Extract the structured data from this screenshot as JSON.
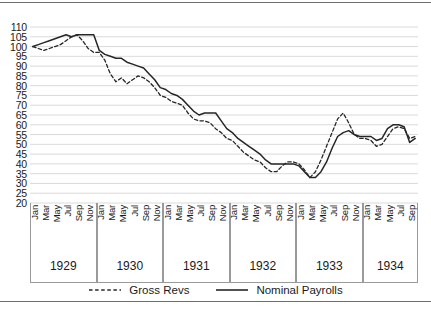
{
  "chart_data": {
    "type": "line",
    "title": "",
    "xlabel": "",
    "ylabel": "",
    "ylim": [
      20,
      110
    ],
    "ytick_step": 5,
    "grid": true,
    "legend_position": "bottom-center",
    "yticks": [
      110,
      105,
      100,
      95,
      90,
      85,
      80,
      75,
      70,
      65,
      60,
      55,
      50,
      45,
      40,
      35,
      30,
      25,
      20
    ],
    "years": [
      {
        "label": "1929",
        "months": [
          "Jan",
          "Mar",
          "May",
          "Jul",
          "Sep",
          "Nov"
        ],
        "n_points": 12
      },
      {
        "label": "1930",
        "months": [
          "Jan",
          "Mar",
          "May",
          "Jul",
          "Sep",
          "Nov"
        ],
        "n_points": 12
      },
      {
        "label": "1931",
        "months": [
          "Jan",
          "Mar",
          "May",
          "Jul",
          "Sep",
          "Nov"
        ],
        "n_points": 12
      },
      {
        "label": "1932",
        "months": [
          "Jan",
          "Mar",
          "May",
          "Jul",
          "Sep",
          "Nov"
        ],
        "n_points": 12
      },
      {
        "label": "1933",
        "months": [
          "Jan",
          "Mar",
          "May",
          "Jul",
          "Sep",
          "Nov"
        ],
        "n_points": 12
      },
      {
        "label": "1934",
        "months": [
          "Jan",
          "Mar",
          "May",
          "Jul",
          "Sep"
        ],
        "n_points": 10
      }
    ],
    "x": [
      "1929-01",
      "1929-02",
      "1929-03",
      "1929-04",
      "1929-05",
      "1929-06",
      "1929-07",
      "1929-08",
      "1929-09",
      "1929-10",
      "1929-11",
      "1929-12",
      "1930-01",
      "1930-02",
      "1930-03",
      "1930-04",
      "1930-05",
      "1930-06",
      "1930-07",
      "1930-08",
      "1930-09",
      "1930-10",
      "1930-11",
      "1930-12",
      "1931-01",
      "1931-02",
      "1931-03",
      "1931-04",
      "1931-05",
      "1931-06",
      "1931-07",
      "1931-08",
      "1931-09",
      "1931-10",
      "1931-11",
      "1931-12",
      "1932-01",
      "1932-02",
      "1932-03",
      "1932-04",
      "1932-05",
      "1932-06",
      "1932-07",
      "1932-08",
      "1932-09",
      "1932-10",
      "1932-11",
      "1932-12",
      "1933-01",
      "1933-02",
      "1933-03",
      "1933-04",
      "1933-05",
      "1933-06",
      "1933-07",
      "1933-08",
      "1933-09",
      "1933-10",
      "1933-11",
      "1933-12",
      "1934-01",
      "1934-02",
      "1934-03",
      "1934-04",
      "1934-05",
      "1934-06",
      "1934-07",
      "1934-08",
      "1934-09",
      "1934-10"
    ],
    "series": [
      {
        "name": "Gross Revs",
        "style": "dashed",
        "color": "#262626",
        "values": [
          100,
          99,
          98,
          99,
          100,
          101,
          103,
          105,
          106,
          103,
          99,
          97,
          97,
          93,
          86,
          82,
          84,
          81,
          83,
          85,
          84,
          82,
          79,
          75,
          74,
          72,
          71,
          70,
          66,
          63,
          62,
          62,
          61,
          58,
          56,
          53,
          52,
          49,
          46,
          44,
          42,
          41,
          38,
          36,
          36,
          39,
          41,
          41,
          40,
          37,
          33,
          36,
          42,
          49,
          56,
          63,
          66,
          61,
          55,
          53,
          53,
          52,
          49,
          50,
          54,
          58,
          59,
          58,
          53,
          54
        ]
      },
      {
        "name": "Nominal Payrolls",
        "style": "solid",
        "color": "#262626",
        "values": [
          100,
          101,
          102,
          103,
          104,
          105,
          106,
          105,
          106,
          106,
          106,
          106,
          98,
          96,
          95,
          94,
          94,
          92,
          91,
          90,
          89,
          86,
          83,
          79,
          78,
          76,
          75,
          73,
          70,
          67,
          65,
          66,
          66,
          66,
          62,
          58,
          56,
          53,
          51,
          49,
          47,
          45,
          42,
          40,
          40,
          40,
          40,
          40,
          39,
          36,
          33,
          33,
          36,
          41,
          48,
          54,
          56,
          57,
          55,
          54,
          54,
          54,
          52,
          53,
          58,
          60,
          60,
          59,
          51,
          53
        ]
      }
    ]
  },
  "legend": {
    "items": [
      {
        "label": "Gross Revs",
        "style": "dashed"
      },
      {
        "label": "Nominal Payrolls",
        "style": "solid"
      }
    ]
  }
}
